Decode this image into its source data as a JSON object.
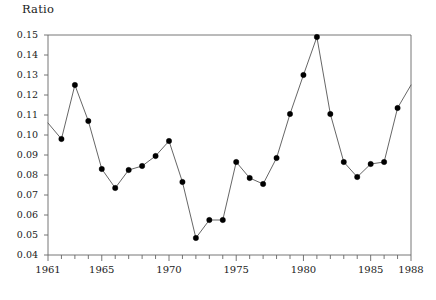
{
  "chart_data": {
    "type": "line",
    "title": "",
    "ylabel": "Ratio",
    "xlabel": "",
    "ylim": [
      0.04,
      0.15
    ],
    "xlim": [
      1961,
      1988
    ],
    "grid": false,
    "legend": null,
    "marker": "filled-circle",
    "x": [
      1961,
      1962,
      1963,
      1964,
      1965,
      1966,
      1967,
      1968,
      1969,
      1970,
      1971,
      1972,
      1973,
      1974,
      1975,
      1976,
      1977,
      1978,
      1979,
      1980,
      1981,
      1982,
      1983,
      1984,
      1985,
      1986,
      1987,
      1988
    ],
    "values": [
      0.106,
      0.098,
      0.125,
      0.107,
      0.083,
      0.0735,
      0.0825,
      0.0845,
      0.0895,
      0.097,
      0.0765,
      0.0485,
      0.0575,
      0.0575,
      0.0865,
      0.0785,
      0.0755,
      0.0885,
      0.1105,
      0.13,
      0.149,
      0.1105,
      0.0865,
      0.079,
      0.0855,
      0.0865,
      0.1135,
      0.125
    ],
    "marker_visible": [
      false,
      true,
      true,
      true,
      true,
      true,
      true,
      true,
      true,
      true,
      true,
      true,
      true,
      true,
      true,
      true,
      true,
      true,
      true,
      true,
      true,
      true,
      true,
      true,
      true,
      true,
      true,
      false
    ],
    "ytick_labels": [
      "0.15",
      "0.14",
      "0.13",
      "0.12",
      "0.11",
      "0.10",
      "0.09",
      "0.08",
      "0.07",
      "0.06",
      "0.05",
      "0.04"
    ],
    "ytick_values": [
      0.15,
      0.14,
      0.13,
      0.12,
      0.11,
      0.1,
      0.09,
      0.08,
      0.07,
      0.06,
      0.05,
      0.04
    ],
    "xtick_labels": [
      "1961",
      "1965",
      "1970",
      "1975",
      "1980",
      "1985",
      "1988"
    ],
    "xtick_values": [
      1961,
      1965,
      1970,
      1975,
      1980,
      1985,
      1988
    ],
    "xtick_minor_values": [
      1962,
      1963,
      1964,
      1966,
      1967,
      1968,
      1969,
      1971,
      1972,
      1973,
      1974,
      1976,
      1977,
      1978,
      1979,
      1981,
      1982,
      1983,
      1984,
      1986,
      1987
    ],
    "line_color": "#555555",
    "marker_color": "#000000",
    "axis_color": "#666666"
  }
}
